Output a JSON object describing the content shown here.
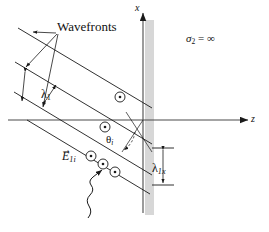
{
  "figure": {
    "background_color": "#ffffff",
    "line_color": "#1a1a1a",
    "conductor_band_color": "#c9c9c9",
    "width": 269,
    "height": 232
  },
  "axes": {
    "x_label": "x",
    "z_label": "z",
    "origin": {
      "x": 143,
      "y": 120
    }
  },
  "region": {
    "conductivity_label": "σ",
    "conductivity_subscript": "2",
    "conductivity_relation": "=",
    "conductivity_value": "∞",
    "conductivity_full": "σ₂ = ∞"
  },
  "annotations": {
    "wavefronts_label": "Wavefronts",
    "wavelength_label": "λ",
    "wavelength_subscript": "1",
    "wavelength_full": "λ₁",
    "wavelength_x_label": "λ",
    "wavelength_x_subscript": "1x",
    "wavelength_x_full": "λ₁ₓ",
    "angle_label": "θ",
    "angle_subscript": "i",
    "angle_full": "θᵢ",
    "efield_label": "E",
    "efield_subscript": "1i",
    "efield_arrow": "→",
    "efield_full": "E⃗₁ᵢ"
  },
  "field_markers": {
    "symbol_name": "circled-dot-out-of-page",
    "count": 6,
    "positions": [
      {
        "x": 120,
        "y": 97
      },
      {
        "x": 105,
        "y": 127
      },
      {
        "x": 74,
        "y": 159
      },
      {
        "x": 90,
        "y": 166
      },
      {
        "x": 103,
        "y": 175
      },
      {
        "x": 176,
        "y": 109
      }
    ]
  },
  "wavefronts": {
    "count": 4,
    "direction": "down-right",
    "description": "four parallel oblique wavefront lines travelling toward the conductor"
  },
  "propagation": {
    "marker_name": "wavy-propagation-arrow",
    "description": "squiggly arrow indicating incident wave propagation direction"
  }
}
